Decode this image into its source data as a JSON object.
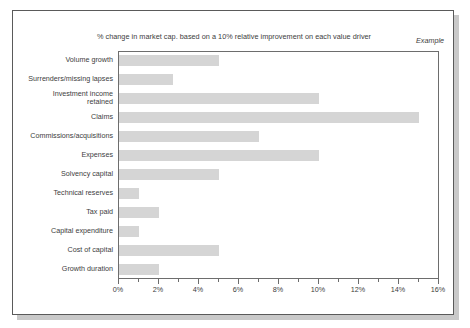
{
  "chart_data": {
    "type": "bar",
    "orientation": "horizontal",
    "title": "% change in market cap. based on a 10% relative improvement on each value driver",
    "annotation": "Example",
    "xlabel": "",
    "ylabel": "",
    "xlim": [
      0,
      16
    ],
    "xtick_step": 2,
    "xticks": [
      "0%",
      "2%",
      "4%",
      "6%",
      "8%",
      "10%",
      "12%",
      "14%",
      "16%"
    ],
    "xtick_values": [
      0,
      2,
      4,
      6,
      8,
      10,
      12,
      14,
      16
    ],
    "minor_tick_step": 1,
    "grid": false,
    "legend": false,
    "bar_color": "#d5d5d5",
    "axis_color": "#6d6d6d",
    "text_color": "#3d3d3d",
    "categories": [
      "Volume growth",
      "Surrenders/missing lapses",
      "Investment income\nretained",
      "Claims",
      "Commissions/acquisitions",
      "Expenses",
      "Solvency capital",
      "Technical reserves",
      "Tax paid",
      "Capital expenditure",
      "Cost of capital",
      "Growth duration"
    ],
    "values": [
      5.0,
      2.7,
      10.0,
      15.0,
      7.0,
      10.0,
      5.0,
      1.0,
      2.0,
      1.0,
      5.0,
      2.0
    ]
  }
}
